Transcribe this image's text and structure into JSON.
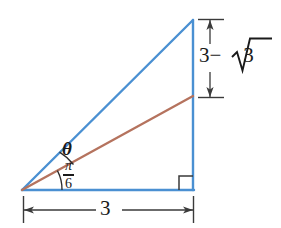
{
  "figure": {
    "type": "geometry-diagram",
    "colors": {
      "triangle_stroke": "#4a90d2",
      "ray_stroke": "#b5735e",
      "annotation_stroke": "#3a3a3a",
      "text": "#1a1a1a",
      "background": "#ffffff"
    },
    "triangle": {
      "vertices": {
        "bottom_left": [
          22,
          190
        ],
        "bottom_right": [
          193,
          190
        ],
        "apex": [
          193,
          20
        ]
      },
      "right_angle_at": "bottom_right"
    },
    "ray": {
      "from": [
        22,
        190
      ],
      "to": [
        193,
        96
      ]
    },
    "angles": [
      {
        "name": "theta",
        "label": "θ",
        "between": "ray-and-hypotenuse"
      },
      {
        "name": "pi-over-six",
        "numerator": "π",
        "denominator": "6",
        "between": "base-and-ray"
      }
    ],
    "dimensions": [
      {
        "name": "vertical-upper-segment",
        "label": "3 − √3",
        "label_parts": {
          "first": "3",
          "operator": "−",
          "radicand": "3"
        },
        "orientation": "vertical",
        "from": [
          210,
          19
        ],
        "to": [
          210,
          98
        ]
      },
      {
        "name": "base",
        "label": "3",
        "orientation": "horizontal",
        "from": [
          23,
          210
        ],
        "to": [
          194,
          210
        ]
      }
    ]
  },
  "labels": {
    "theta": "θ",
    "pi_numerator": "π",
    "pi_denominator": "6",
    "height_first": "3",
    "height_operator": "−",
    "height_radicand": "3",
    "base": "3"
  }
}
